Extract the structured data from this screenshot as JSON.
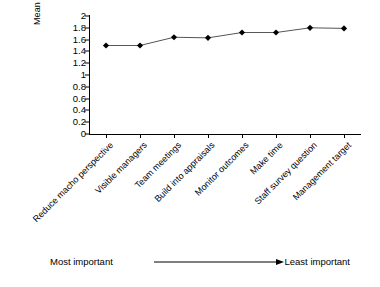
{
  "chart_data": {
    "type": "line",
    "title": "",
    "xlabel": "",
    "ylabel": "Mean score",
    "ylim": [
      0,
      2
    ],
    "ytick_step": 0.2,
    "grid": false,
    "legend": false,
    "marker": "diamond",
    "marker_color": "#000000",
    "line_color": "#555555",
    "categories": [
      "Reduce macho perspective",
      "Visible managers",
      "Team meetings",
      "Build into appraisals",
      "Monitor outcomes",
      "Make time",
      "Staff survey question",
      "Management target"
    ],
    "values": [
      1.5,
      1.5,
      1.64,
      1.63,
      1.72,
      1.72,
      1.8,
      1.79
    ],
    "ytick_labels": [
      "0",
      "0.2",
      "0.4",
      "0.6",
      "0.8",
      "1",
      "1.2",
      "1.4",
      "1.6",
      "1.8",
      "2"
    ],
    "ytick_values": [
      0,
      0.2,
      0.4,
      0.6,
      0.8,
      1,
      1.2,
      1.4,
      1.6,
      1.8,
      2
    ]
  },
  "annotation": {
    "left_label": "Most  important",
    "right_label": "Least important",
    "arrow_direction": "right"
  }
}
